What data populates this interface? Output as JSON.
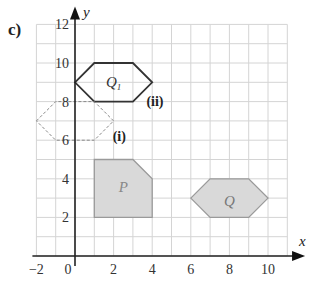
{
  "part_label": "c)",
  "axes": {
    "x_label": "x",
    "y_label": "y",
    "x_ticks": [
      "−2",
      "0",
      "2",
      "4",
      "6",
      "8",
      "10"
    ],
    "y_ticks": [
      "2",
      "4",
      "6",
      "8",
      "10",
      "12"
    ],
    "x_range": [
      -2,
      11
    ],
    "y_range": [
      0,
      12
    ]
  },
  "shapes": {
    "P": {
      "label": "P",
      "vertices": [
        [
          1,
          2
        ],
        [
          1,
          5
        ],
        [
          3,
          5
        ],
        [
          4,
          4
        ],
        [
          4,
          2
        ]
      ],
      "fill": "#d9d9d9",
      "stroke": "#9a9a9a"
    },
    "Q": {
      "label": "Q",
      "vertices": [
        [
          6,
          3
        ],
        [
          7,
          4
        ],
        [
          9,
          4
        ],
        [
          10,
          3
        ],
        [
          9,
          2
        ],
        [
          7,
          2
        ]
      ],
      "fill": "#d9d9d9",
      "stroke": "#9a9a9a"
    },
    "Q1": {
      "label": "Q",
      "subscript": "1",
      "vertices": [
        [
          0,
          9
        ],
        [
          1,
          10
        ],
        [
          3,
          10
        ],
        [
          4,
          9
        ],
        [
          3,
          8
        ],
        [
          1,
          8
        ]
      ],
      "stroke": "#333333"
    },
    "image_i": {
      "vertices": [
        [
          -2,
          7
        ],
        [
          -1,
          8
        ],
        [
          1,
          8
        ],
        [
          2,
          7
        ],
        [
          1,
          6
        ],
        [
          -1,
          6
        ]
      ],
      "stroke": "#888888",
      "dashed": true
    }
  },
  "annotations": {
    "i": "(i)",
    "ii": "(ii)"
  }
}
